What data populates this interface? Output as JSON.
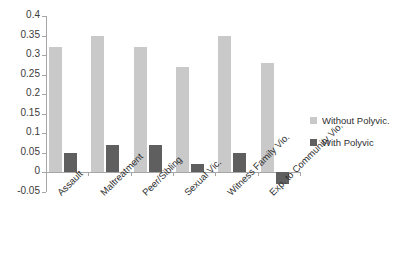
{
  "chart_data": {
    "type": "bar",
    "title": "",
    "subtitle": "",
    "xlabel": "",
    "ylabel": "",
    "categories": [
      "Assault",
      "Maltreatment",
      "Peer/Sibling",
      "Sexual Vic.",
      "Witness Family Vio.",
      "Exp. to Community Vio."
    ],
    "series": [
      {
        "name": "Without Polyvic.",
        "color": "#c9c9c9",
        "values": [
          0.32,
          0.35,
          0.32,
          0.27,
          0.35,
          0.28
        ]
      },
      {
        "name": "With Polyvic",
        "color": "#5f5f5f",
        "values": [
          0.05,
          0.07,
          0.07,
          0.02,
          0.05,
          -0.03
        ]
      }
    ],
    "ylim": [
      -0.05,
      0.4
    ],
    "ytick_values": [
      -0.05,
      0,
      0.05,
      0.1,
      0.15,
      0.2,
      0.25,
      0.3,
      0.35,
      0.4
    ],
    "ytick_labels": [
      "-0.05",
      "0",
      "0.05",
      "0.1",
      "0.15",
      "0.2",
      "0.25",
      "0.3",
      "0.35",
      "0.4"
    ],
    "grid": false,
    "legend_position": "right"
  },
  "legend": {
    "entries": [
      {
        "label": "Without Polyvic."
      },
      {
        "label": "With Polyvic"
      }
    ]
  }
}
